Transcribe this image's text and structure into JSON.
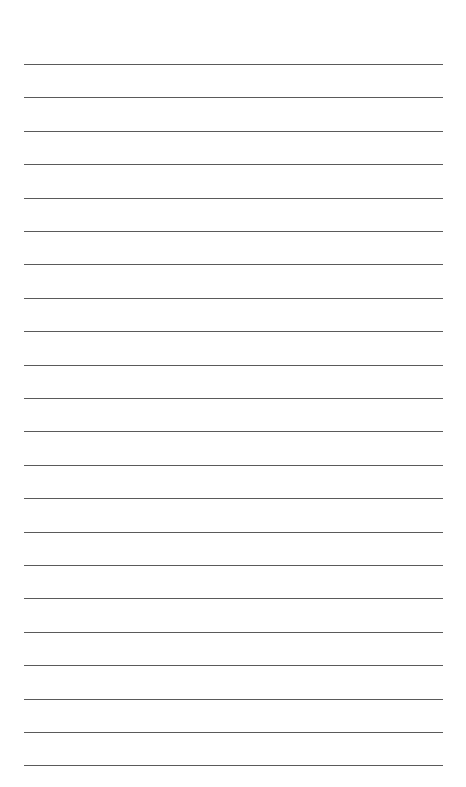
{
  "page": {
    "type": "lined-paper",
    "background": "#ffffff",
    "line_color": "#5a5a5a",
    "line_count": 22,
    "first_line_y": 64,
    "line_spacing": 33.4,
    "line_left": 24,
    "line_width": 419
  }
}
